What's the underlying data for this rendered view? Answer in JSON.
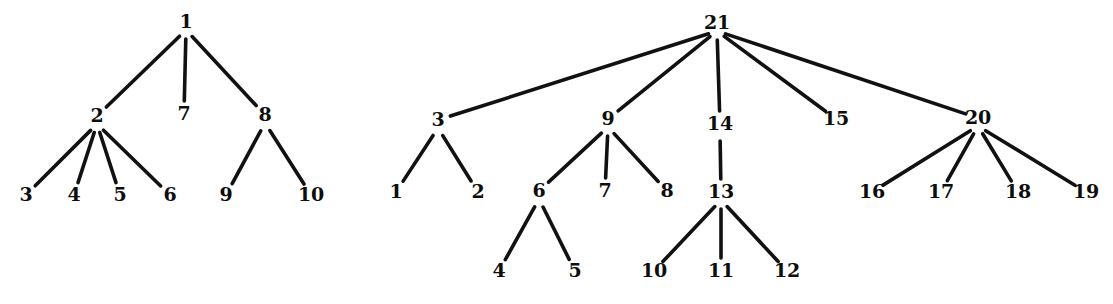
{
  "figure": {
    "background_color": "#ffffff",
    "line_color": "#111111",
    "label_color": "#0d0d0d",
    "width": 1113,
    "height": 304
  },
  "chart_data": {
    "type": "diagram",
    "subtype": "rooted-tree-graph",
    "graphs": [
      {
        "name": "left-tree",
        "root": "1",
        "node_count": 10,
        "nodes": [
          {
            "id": "1",
            "label": "1",
            "x": 186,
            "y": 28,
            "depth": 0
          },
          {
            "id": "2",
            "label": "2",
            "x": 97,
            "y": 122,
            "depth": 1
          },
          {
            "id": "7",
            "label": "7",
            "x": 184,
            "y": 120,
            "depth": 1
          },
          {
            "id": "8",
            "label": "8",
            "x": 265,
            "y": 121,
            "depth": 1
          },
          {
            "id": "3",
            "label": "3",
            "x": 26,
            "y": 201,
            "depth": 2
          },
          {
            "id": "4",
            "label": "4",
            "x": 74,
            "y": 201,
            "depth": 2
          },
          {
            "id": "5",
            "label": "5",
            "x": 120,
            "y": 201,
            "depth": 2
          },
          {
            "id": "6",
            "label": "6",
            "x": 170,
            "y": 201,
            "depth": 2
          },
          {
            "id": "9",
            "label": "9",
            "x": 226,
            "y": 201,
            "depth": 2
          },
          {
            "id": "10",
            "label": "10",
            "x": 311,
            "y": 201,
            "depth": 2
          }
        ],
        "edges": [
          {
            "from": "1",
            "to": "2"
          },
          {
            "from": "1",
            "to": "7"
          },
          {
            "from": "1",
            "to": "8"
          },
          {
            "from": "2",
            "to": "3"
          },
          {
            "from": "2",
            "to": "4"
          },
          {
            "from": "2",
            "to": "5"
          },
          {
            "from": "2",
            "to": "6"
          },
          {
            "from": "8",
            "to": "9"
          },
          {
            "from": "8",
            "to": "10"
          }
        ]
      },
      {
        "name": "right-tree",
        "root": "21",
        "node_count": 21,
        "nodes": [
          {
            "id": "21",
            "label": "21",
            "x": 717,
            "y": 29,
            "depth": 0
          },
          {
            "id": "3",
            "label": "3",
            "x": 438,
            "y": 126,
            "depth": 1
          },
          {
            "id": "9",
            "label": "9",
            "x": 608,
            "y": 125,
            "depth": 1
          },
          {
            "id": "14",
            "label": "14",
            "x": 720,
            "y": 130,
            "depth": 1
          },
          {
            "id": "15",
            "label": "15",
            "x": 836,
            "y": 125,
            "depth": 1
          },
          {
            "id": "20",
            "label": "20",
            "x": 978,
            "y": 124,
            "depth": 1
          },
          {
            "id": "1",
            "label": "1",
            "x": 396,
            "y": 198,
            "depth": 2
          },
          {
            "id": "2",
            "label": "2",
            "x": 478,
            "y": 198,
            "depth": 2
          },
          {
            "id": "6",
            "label": "6",
            "x": 539,
            "y": 197,
            "depth": 2
          },
          {
            "id": "7",
            "label": "7",
            "x": 605,
            "y": 197,
            "depth": 2
          },
          {
            "id": "8",
            "label": "8",
            "x": 667,
            "y": 197,
            "depth": 2
          },
          {
            "id": "13",
            "label": "13",
            "x": 721,
            "y": 198,
            "depth": 2
          },
          {
            "id": "16",
            "label": "16",
            "x": 872,
            "y": 198,
            "depth": 2
          },
          {
            "id": "17",
            "label": "17",
            "x": 941,
            "y": 198,
            "depth": 2
          },
          {
            "id": "18",
            "label": "18",
            "x": 1018,
            "y": 198,
            "depth": 2
          },
          {
            "id": "19",
            "label": "19",
            "x": 1086,
            "y": 198,
            "depth": 2
          },
          {
            "id": "4",
            "label": "4",
            "x": 499,
            "y": 277,
            "depth": 3
          },
          {
            "id": "5",
            "label": "5",
            "x": 575,
            "y": 277,
            "depth": 3
          },
          {
            "id": "10",
            "label": "10",
            "x": 654,
            "y": 277,
            "depth": 3
          },
          {
            "id": "11",
            "label": "11",
            "x": 721,
            "y": 277,
            "depth": 3
          },
          {
            "id": "12",
            "label": "12",
            "x": 787,
            "y": 277,
            "depth": 3
          }
        ],
        "edges": [
          {
            "from": "21",
            "to": "3"
          },
          {
            "from": "21",
            "to": "9"
          },
          {
            "from": "21",
            "to": "14"
          },
          {
            "from": "21",
            "to": "15"
          },
          {
            "from": "21",
            "to": "20"
          },
          {
            "from": "3",
            "to": "1"
          },
          {
            "from": "3",
            "to": "2"
          },
          {
            "from": "9",
            "to": "6"
          },
          {
            "from": "9",
            "to": "7"
          },
          {
            "from": "9",
            "to": "8"
          },
          {
            "from": "14",
            "to": "13"
          },
          {
            "from": "13",
            "to": "10"
          },
          {
            "from": "13",
            "to": "11"
          },
          {
            "from": "13",
            "to": "12"
          },
          {
            "from": "6",
            "to": "4"
          },
          {
            "from": "6",
            "to": "5"
          },
          {
            "from": "20",
            "to": "16"
          },
          {
            "from": "20",
            "to": "17"
          },
          {
            "from": "20",
            "to": "18"
          },
          {
            "from": "20",
            "to": "19"
          }
        ]
      }
    ]
  }
}
